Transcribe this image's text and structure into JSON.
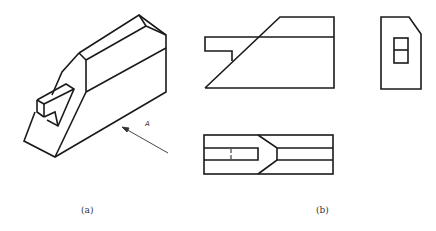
{
  "figure": {
    "panel_a": {
      "caption": "(a)",
      "view_direction_label": "A",
      "description": "Isometric view of a block with chamfered top and a notched tab"
    },
    "panel_b": {
      "caption": "(b)",
      "views": [
        "front-view",
        "side-view",
        "top-view"
      ]
    },
    "line_color": "#1a1a1a"
  }
}
